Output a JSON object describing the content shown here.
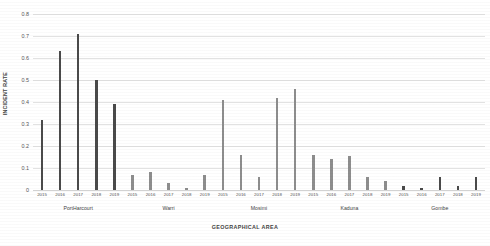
{
  "chart_data": {
    "type": "bar",
    "title": "",
    "xlabel": "GEOGRAPHICAL AREA",
    "ylabel": "INCIDENT RATE",
    "ylim": [
      0,
      0.8
    ],
    "ytick_labels": [
      "0.8",
      "0.7",
      "0.6",
      "0.5",
      "0.4",
      "0.3",
      "0.2",
      "0.1",
      "0"
    ],
    "ytick_values": [
      0.8,
      0.7,
      0.6,
      0.5,
      0.4,
      0.3,
      0.2,
      0.1,
      0
    ],
    "grid": true,
    "legend": "none",
    "categories": [
      "PortHarcourt",
      "Warri",
      "Mosimi",
      "Kaduna",
      "Gombe"
    ],
    "x": [
      "2015",
      "2016",
      "2017",
      "2018",
      "2019"
    ],
    "groups": [
      {
        "name": "PortHarcourt",
        "color": "#4a4a4a",
        "bars": [
          {
            "year": "2015",
            "value": 0.32
          },
          {
            "year": "2016",
            "value": 0.63
          },
          {
            "year": "2017",
            "value": 0.71
          },
          {
            "year": "2018",
            "value": 0.5
          },
          {
            "year": "2019",
            "value": 0.39
          }
        ]
      },
      {
        "name": "Warri",
        "color": "#8d8d8d",
        "bars": [
          {
            "year": "2015",
            "value": 0.07
          },
          {
            "year": "2016",
            "value": 0.08
          },
          {
            "year": "2017",
            "value": 0.03
          },
          {
            "year": "2018",
            "value": 0.01
          },
          {
            "year": "2019",
            "value": 0.07
          }
        ]
      },
      {
        "name": "Mosimi",
        "color": "#8d8d8d",
        "bars": [
          {
            "year": "2015",
            "value": 0.41
          },
          {
            "year": "2016",
            "value": 0.16
          },
          {
            "year": "2017",
            "value": 0.06
          },
          {
            "year": "2018",
            "value": 0.42
          },
          {
            "year": "2019",
            "value": 0.46
          }
        ]
      },
      {
        "name": "Kaduna",
        "color": "#8d8d8d",
        "bars": [
          {
            "year": "2015",
            "value": 0.16
          },
          {
            "year": "2016",
            "value": 0.14
          },
          {
            "year": "2017",
            "value": 0.155
          },
          {
            "year": "2018",
            "value": 0.06
          },
          {
            "year": "2019",
            "value": 0.04
          }
        ]
      },
      {
        "name": "Gombe",
        "color": "#4a4a4a",
        "bars": [
          {
            "year": "2015",
            "value": 0.02
          },
          {
            "year": "2016",
            "value": 0.01
          },
          {
            "year": "2017",
            "value": 0.06
          },
          {
            "year": "2018",
            "value": 0.02
          },
          {
            "year": "2019",
            "value": 0.06
          }
        ]
      }
    ]
  }
}
